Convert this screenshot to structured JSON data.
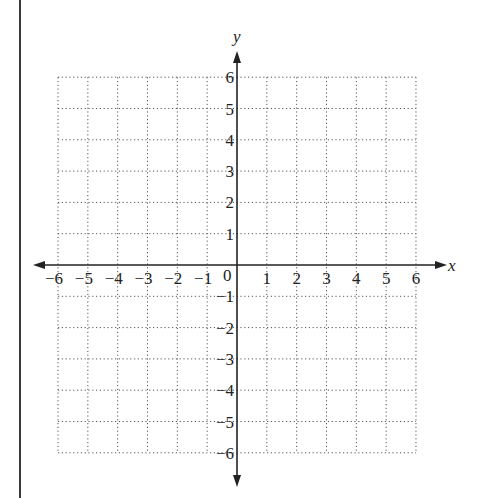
{
  "diagram": {
    "type": "coordinate-plane",
    "x_axis_label": "x",
    "y_axis_label": "y",
    "origin_label": "0",
    "x_ticks": [
      "-6",
      "-5",
      "-4",
      "-3",
      "-2",
      "-1",
      "1",
      "2",
      "3",
      "4",
      "5",
      "6"
    ],
    "y_ticks": [
      "6",
      "5",
      "4",
      "3",
      "2",
      "1",
      "-1",
      "-2",
      "-3",
      "-4",
      "-5",
      "-6"
    ],
    "x_range": [
      -6,
      6
    ],
    "y_range": [
      -6,
      6
    ],
    "grid": "dotted",
    "colors": {
      "axis": "#222222",
      "grid": "#555555",
      "border": "#3a3a3a"
    }
  }
}
